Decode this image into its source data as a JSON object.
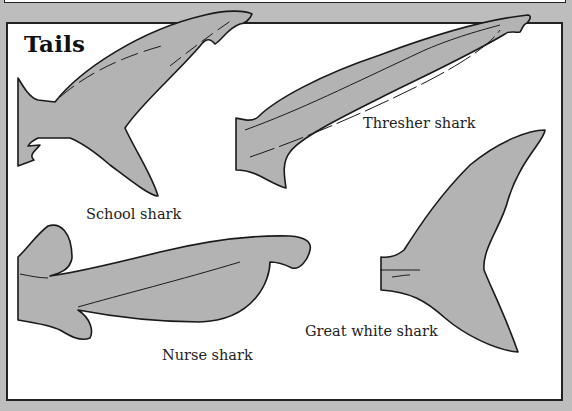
{
  "title": "Tails",
  "colors": {
    "background": "#bdbdbd",
    "panel": "#ffffff",
    "tail_fill": "#b3b3b3",
    "outline": "#1a1a1a"
  },
  "tails": [
    {
      "id": "school",
      "label": "School shark"
    },
    {
      "id": "thresher",
      "label": "Thresher shark"
    },
    {
      "id": "nurse",
      "label": "Nurse shark"
    },
    {
      "id": "great-white",
      "label": "Great white shark"
    }
  ]
}
